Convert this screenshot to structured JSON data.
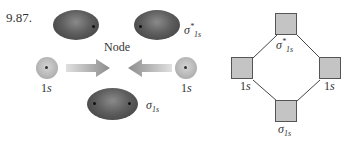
{
  "problem": {
    "number": "9.87."
  },
  "left_panel": {
    "node_label": "Node",
    "antibonding": {
      "symbol": "σ",
      "sup": "*",
      "sub": "1s"
    },
    "bonding": {
      "symbol": "σ",
      "sub": "1s"
    },
    "atomic_left": {
      "num": "1",
      "orb": "s"
    },
    "atomic_right": {
      "num": "1",
      "orb": "s"
    },
    "colors": {
      "ellipse": "#5e5e5e",
      "sphere": "#b8b8b8",
      "arrow": "#9a9a9a"
    }
  },
  "right_panel": {
    "top": {
      "symbol": "σ",
      "sup": "*",
      "sub": "1s"
    },
    "bottom": {
      "symbol": "σ",
      "sub": "1s"
    },
    "left": {
      "num": "1",
      "orb": "s"
    },
    "right": {
      "num": "1",
      "orb": "s"
    },
    "colors": {
      "square_fill": "#c4c4c4",
      "line": "#444444"
    }
  }
}
